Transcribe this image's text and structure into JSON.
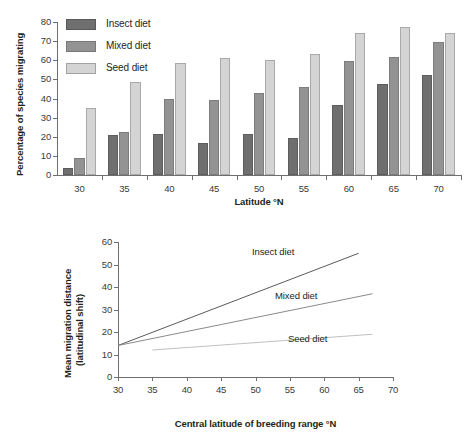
{
  "chart_data": [
    {
      "type": "bar",
      "title": "",
      "xlabel": "Latitude °N",
      "ylabel": "Percentage of species migrating",
      "categories": [
        "30",
        "35",
        "40",
        "45",
        "50",
        "55",
        "60",
        "65",
        "70"
      ],
      "ylim": [
        0,
        80
      ],
      "yticks": [
        0,
        10,
        20,
        30,
        40,
        50,
        60,
        70,
        80
      ],
      "grid": false,
      "legend_position": "top-left",
      "series": [
        {
          "name": "Insect diet",
          "color": "#6f6f6f",
          "values": [
            3.5,
            21,
            21.5,
            17,
            21.5,
            19.5,
            36.5,
            47.5,
            52.5
          ]
        },
        {
          "name": "Mixed diet",
          "color": "#939393",
          "values": [
            9,
            22.5,
            40,
            39,
            43,
            46,
            59.5,
            61.5,
            69.5
          ]
        },
        {
          "name": "Seed diet",
          "color": "#d4d4d4",
          "values": [
            35,
            48.5,
            58.5,
            61,
            60,
            63.5,
            74.5,
            77.5,
            74.5
          ]
        }
      ]
    },
    {
      "type": "line",
      "title": "",
      "xlabel": "Central latitude of breeding range °N",
      "ylabel": "Mean migration distance (latitudinal shift)",
      "ylabel_line1": "Mean migration distance",
      "ylabel_line2": "(latitudinal shift)",
      "xlim": [
        30,
        70
      ],
      "ylim": [
        0,
        60
      ],
      "xticks": [
        30,
        35,
        40,
        45,
        50,
        55,
        60,
        65,
        70
      ],
      "yticks": [
        0,
        10,
        20,
        30,
        40,
        50,
        60
      ],
      "grid": false,
      "legend_position": "inline-labels",
      "series": [
        {
          "name": "Insect diet",
          "color": "#5a5a5a",
          "x": [
            30,
            65
          ],
          "y": [
            14,
            55
          ]
        },
        {
          "name": "Mixed diet",
          "color": "#8a8a8a",
          "x": [
            30,
            67
          ],
          "y": [
            14,
            37
          ]
        },
        {
          "name": "Seed diet",
          "color": "#c0c0c0",
          "x": [
            35,
            67
          ],
          "y": [
            12,
            19
          ]
        }
      ]
    }
  ],
  "bar_chart": {
    "ylabel": "Percentage of species migrating",
    "xlabel": "Latitude °N",
    "legend": [
      {
        "label": "Insect diet"
      },
      {
        "label": "Mixed diet"
      },
      {
        "label": "Seed diet"
      }
    ]
  },
  "line_chart": {
    "ylabel_line1": "Mean migration distance",
    "ylabel_line2": "(latitudinal shift)",
    "xlabel": "Central latitude of breeding range °N",
    "labels": [
      {
        "label": "Insect diet"
      },
      {
        "label": "Mixed diet"
      },
      {
        "label": "Seed diet"
      }
    ]
  }
}
